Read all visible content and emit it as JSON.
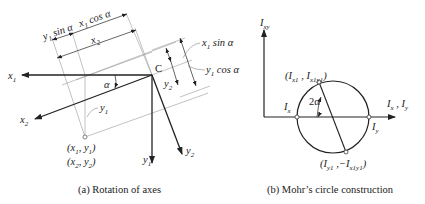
{
  "figure_a": {
    "caption": "(a) Rotation of axes",
    "origin_label": "C",
    "angle_label": "α",
    "axes": {
      "x1": "x1",
      "x2": "x2",
      "y1": "y1",
      "y2": "y2"
    },
    "dimension_labels": {
      "y1_sin": "y1 sin α",
      "x1_cos": "x1 cos α",
      "x2": "x2",
      "x1_sin": "x1 sin α",
      "y1_cos": "y1 cos α",
      "y2": "y2",
      "y1": "y1"
    },
    "point_labels": [
      "(x1, y1)",
      "(x2, y2)"
    ]
  },
  "figure_b": {
    "caption": "(b) Mohr’s circle construction",
    "vertical_axis": "Ixy",
    "horizontal_axis": "Ix , Iy",
    "top_point": "(Ix1 , Ix1y1)",
    "bottom_point": "(Iy1 , −Ix1y1)",
    "left_point": "Ix",
    "right_point": "Iy",
    "angle_label": "2α"
  },
  "colors": {
    "line": "#222222",
    "thin": "#888888"
  }
}
